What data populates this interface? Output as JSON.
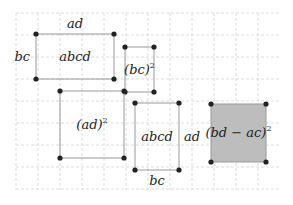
{
  "diagram": {
    "grid": {
      "x0": 16,
      "y0": 13,
      "x1": 279,
      "y1": 190,
      "step": 22,
      "color": "#dcdcdc"
    },
    "rectangles": [
      {
        "id": "rect-abcd-top",
        "x": 36,
        "y": 34,
        "w": 78,
        "h": 45,
        "fill": "none",
        "label": "abcd",
        "top_label": "ad",
        "left_label": "bc"
      },
      {
        "id": "rect-bc-squared",
        "x": 125,
        "y": 47,
        "w": 29,
        "h": 45,
        "fill": "none",
        "label": "(bc)",
        "exp": "2"
      },
      {
        "id": "rect-ad-squared",
        "x": 60,
        "y": 91,
        "w": 64,
        "h": 67,
        "fill": "none",
        "label": "(ad)",
        "exp": "2"
      },
      {
        "id": "rect-abcd-bottom",
        "x": 135,
        "y": 103,
        "w": 44,
        "h": 67,
        "fill": "none",
        "label": "abcd",
        "right_label": "ad",
        "bottom_label": "bc"
      },
      {
        "id": "rect-bd-ac-squared",
        "x": 211,
        "y": 104,
        "w": 55,
        "h": 58,
        "fill": "#bdbdbd",
        "label": "(bd − ac)",
        "exp": "2"
      }
    ],
    "colors": {
      "stroke": "#9a9a9a",
      "dot": "#222222",
      "shaded": "#bdbdbd"
    }
  }
}
